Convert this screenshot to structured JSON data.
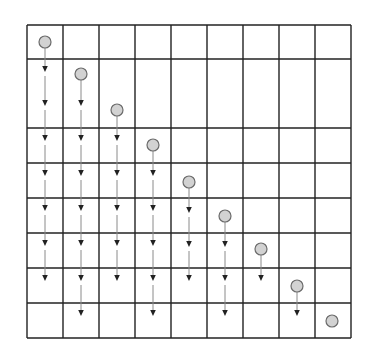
{
  "diagram": {
    "type": "grid-token-drop",
    "canvas": {
      "width": 369,
      "height": 364,
      "background": "#ffffff"
    },
    "grid": {
      "left": 27,
      "top": 25,
      "right": 351,
      "bottom": 338,
      "columns": 9,
      "column_lines_x": [
        27,
        63,
        99,
        135,
        171,
        207,
        243,
        279,
        315,
        351
      ],
      "row_lines_y": [
        25,
        59,
        128,
        163,
        198,
        233,
        268,
        303,
        338
      ],
      "line_color": "#222222",
      "line_width": 1.4
    },
    "style": {
      "circle_fill": "#d2d2d2",
      "circle_stroke": "#6a6a6a",
      "circle_radius": 6,
      "arrow_line_color": "#8a8a8a",
      "arrowhead_color": "#222222"
    },
    "columns": [
      {
        "index": 0,
        "circle": {
          "x": 45,
          "y": 42
        },
        "arrow_tips_y": [
          72,
          106,
          141,
          176,
          211,
          246,
          281
        ]
      },
      {
        "index": 1,
        "circle": {
          "x": 81,
          "y": 74
        },
        "arrow_tips_y": [
          106,
          141,
          176,
          211,
          246,
          281,
          316
        ]
      },
      {
        "index": 2,
        "circle": {
          "x": 117,
          "y": 110
        },
        "arrow_tips_y": [
          141,
          176,
          211,
          246,
          281
        ]
      },
      {
        "index": 3,
        "circle": {
          "x": 153,
          "y": 145
        },
        "arrow_tips_y": [
          176,
          211,
          246,
          281,
          316
        ]
      },
      {
        "index": 4,
        "circle": {
          "x": 189,
          "y": 182
        },
        "arrow_tips_y": [
          213,
          247,
          281
        ]
      },
      {
        "index": 5,
        "circle": {
          "x": 225,
          "y": 216
        },
        "arrow_tips_y": [
          247,
          281,
          316
        ]
      },
      {
        "index": 6,
        "circle": {
          "x": 261,
          "y": 249
        },
        "arrow_tips_y": [
          281
        ]
      },
      {
        "index": 7,
        "circle": {
          "x": 297,
          "y": 286
        },
        "arrow_tips_y": [
          316
        ]
      },
      {
        "index": 8,
        "circle": {
          "x": 332,
          "y": 321
        },
        "arrow_tips_y": []
      }
    ]
  }
}
